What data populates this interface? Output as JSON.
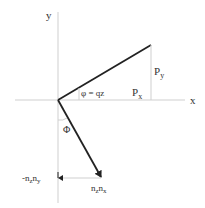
{
  "diagram": {
    "type": "vector-geometry",
    "axes": {
      "x_label": "x",
      "y_label": "y"
    },
    "vector_p": {
      "from": [
        58,
        100
      ],
      "to": [
        151,
        45
      ],
      "components": {
        "px_label": "P",
        "px_sub": "x",
        "py_label": "P",
        "py_sub": "y"
      }
    },
    "angle_phi_small": {
      "label": "φ = qz"
    },
    "angle_phi_large": {
      "label": "Φ"
    },
    "vector_n": {
      "from": [
        58,
        100
      ],
      "to": [
        101,
        177
      ],
      "component_y": {
        "prefix": "-n",
        "sub1": "z",
        "mid": "n",
        "sub2": "y"
      },
      "component_x": {
        "prefix": "n",
        "sub1": "z",
        "mid": "n",
        "sub2": "x"
      }
    },
    "colors": {
      "thin_line": "#cccccc",
      "thick_line": "#222222",
      "text": "#333333"
    }
  }
}
